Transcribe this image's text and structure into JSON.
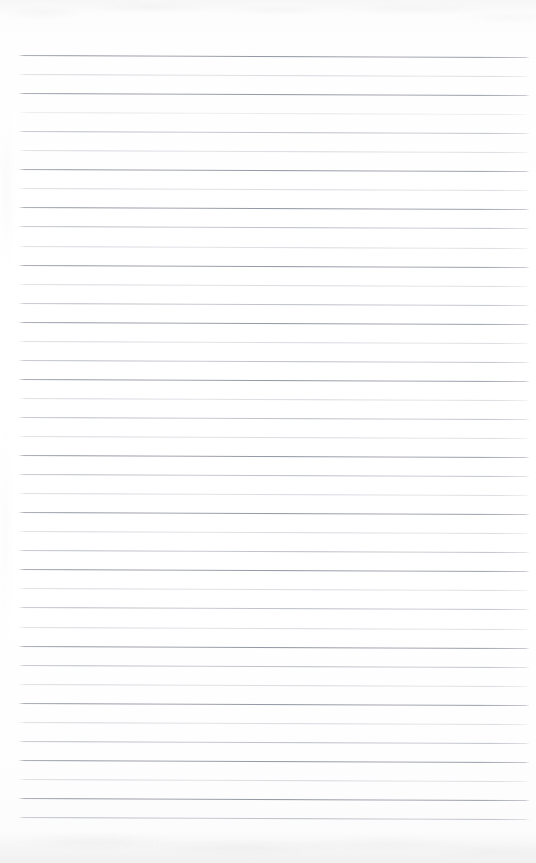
{
  "document": {
    "kind": "scanned-ruled-notebook-page",
    "title": "Blank Lined Notebook Page",
    "page_width": 536,
    "page_height": 863,
    "paper_color": "#fdfdfd",
    "background_color": "#ffffff",
    "content_text": "",
    "has_handwriting": false,
    "has_printed_text": false,
    "has_margin_rule": false,
    "orientation": "portrait"
  },
  "ruling": {
    "line_count": 41,
    "first_line_y": 55,
    "last_line_y": 817,
    "line_spacing": 19.05,
    "line_start_x": 18,
    "line_end_x": 530,
    "line_thickness": 1,
    "skew_degrees": 0.22,
    "line_color_dark": "#8c91a0",
    "line_color_medium": "#a4a8b6",
    "line_color_light": "#b8bcc6",
    "line_color_faint": "#c6c9d1",
    "weights": [
      "dark",
      "light",
      "dark",
      "faint",
      "medium",
      "light",
      "dark",
      "light",
      "dark",
      "medium",
      "light",
      "dark",
      "light",
      "medium",
      "dark",
      "light",
      "medium",
      "dark",
      "light",
      "medium",
      "light",
      "dark",
      "medium",
      "light",
      "dark",
      "light",
      "medium",
      "dark",
      "light",
      "medium",
      "light",
      "dark",
      "medium",
      "light",
      "dark",
      "light",
      "medium",
      "dark",
      "light",
      "dark",
      "medium"
    ]
  },
  "scan_artifacts": {
    "top_edge_noise": true,
    "bottom_edge_shadow": true,
    "left_edge_smudge": true,
    "noise_tint": "#9a9aa2"
  }
}
